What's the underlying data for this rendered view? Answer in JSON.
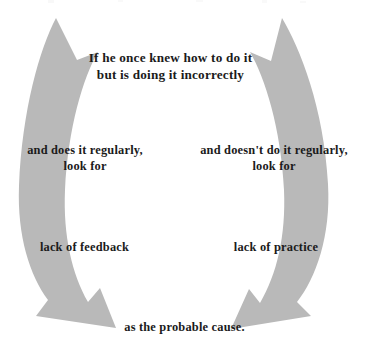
{
  "figure": {
    "title": "If he once knew how to do it\nbut is doing it incorrectly",
    "left_branch_condition": "and does it regularly,\nlook for",
    "right_branch_condition": "and doesn't do it regularly,\nlook for",
    "left_branch_result": "lack of feedback",
    "right_branch_result": "lack of practice",
    "conclusion": "as the probable cause."
  },
  "colors": {
    "arrow_fill": "#b9b9b9",
    "text": "#1b1b1b",
    "background": "#ffffff"
  },
  "diagram": {
    "type": "two-branch-decision-flow",
    "arrow_count": 2,
    "left_arrow_name": "left-curved-down-arrow",
    "right_arrow_name": "right-curved-down-arrow",
    "arrow_direction": "downward-converging"
  }
}
